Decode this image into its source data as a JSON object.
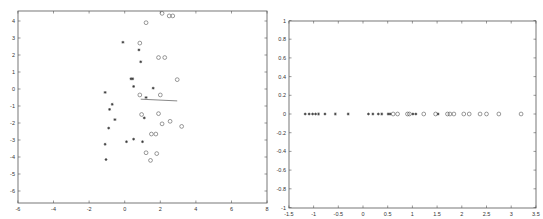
{
  "chart_data": [
    {
      "type": "scatter",
      "title": "",
      "xlabel": "",
      "ylabel": "",
      "xlim": [
        -6,
        8
      ],
      "ylim": [
        -6.6,
        4.5
      ],
      "xticks": [
        -6,
        -4,
        -2,
        0,
        2,
        4,
        6,
        8
      ],
      "yticks": [
        -6,
        -5,
        -4,
        -3,
        -2,
        -1,
        0,
        1,
        2,
        3,
        4
      ],
      "grid": false,
      "legend": null,
      "series": [
        {
          "name": "class 1",
          "marker": "*",
          "points": [
            [
              -0.1,
              2.75
            ],
            [
              0.8,
              2.3
            ],
            [
              0.9,
              1.6
            ],
            [
              0.35,
              0.6
            ],
            [
              0.45,
              0.6
            ],
            [
              0.5,
              0.15
            ],
            [
              1.6,
              0.05
            ],
            [
              1.2,
              -0.5
            ],
            [
              -1.1,
              -0.2
            ],
            [
              -0.7,
              -0.9
            ],
            [
              -0.85,
              -1.2
            ],
            [
              -0.55,
              -1.8
            ],
            [
              1.1,
              -1.7
            ],
            [
              -0.9,
              -2.3
            ],
            [
              0.1,
              -3.1
            ],
            [
              0.5,
              -2.95
            ],
            [
              1.0,
              -3.1
            ],
            [
              -1.1,
              -3.25
            ],
            [
              -1.05,
              -4.15
            ]
          ]
        },
        {
          "name": "class 2",
          "marker": "o",
          "points": [
            [
              2.1,
              4.45
            ],
            [
              2.5,
              4.3
            ],
            [
              2.7,
              4.3
            ],
            [
              1.2,
              3.9
            ],
            [
              0.85,
              2.7
            ],
            [
              1.9,
              1.85
            ],
            [
              2.25,
              1.85
            ],
            [
              2.95,
              0.55
            ],
            [
              0.85,
              -0.35
            ],
            [
              2.0,
              -0.35
            ],
            [
              0.95,
              -1.5
            ],
            [
              1.9,
              -1.45
            ],
            [
              2.1,
              -2.05
            ],
            [
              2.55,
              -1.9
            ],
            [
              3.2,
              -2.2
            ],
            [
              1.5,
              -2.65
            ],
            [
              1.75,
              -2.65
            ],
            [
              1.2,
              -3.75
            ],
            [
              1.8,
              -3.8
            ],
            [
              1.45,
              -4.2
            ]
          ]
        }
      ],
      "annotations": [
        {
          "type": "line",
          "from": [
            0.9,
            -0.6
          ],
          "to": [
            2.95,
            -0.7
          ]
        }
      ]
    },
    {
      "type": "scatter",
      "title": "",
      "xlabel": "",
      "ylabel": "",
      "xlim": [
        -1.5,
        3.5
      ],
      "ylim": [
        -1,
        1
      ],
      "xticks": [
        -1.5,
        -1,
        -0.5,
        0,
        0.5,
        1,
        1.5,
        2,
        2.5,
        3,
        3.5
      ],
      "yticks": [
        -1,
        -0.8,
        -0.6,
        -0.4,
        -0.2,
        0,
        0.2,
        0.4,
        0.6,
        0.8,
        1
      ],
      "grid": false,
      "legend": null,
      "series": [
        {
          "name": "class 1 (projected)",
          "marker": "*",
          "points": [
            [
              -1.17,
              0
            ],
            [
              -1.09,
              0
            ],
            [
              -1.02,
              0
            ],
            [
              -0.96,
              0
            ],
            [
              -0.9,
              0
            ],
            [
              -0.77,
              0
            ],
            [
              -0.56,
              0
            ],
            [
              -0.3,
              0
            ],
            [
              0.11,
              0
            ],
            [
              0.2,
              0
            ],
            [
              0.31,
              0
            ],
            [
              0.38,
              0
            ],
            [
              0.51,
              0
            ],
            [
              0.55,
              0
            ],
            [
              1.01,
              0
            ],
            [
              1.07,
              0
            ],
            [
              1.52,
              0
            ]
          ]
        },
        {
          "name": "class 2 (projected)",
          "marker": "o",
          "points": [
            [
              0.61,
              0
            ],
            [
              0.7,
              0
            ],
            [
              0.9,
              0
            ],
            [
              0.94,
              0
            ],
            [
              1.23,
              0
            ],
            [
              1.47,
              0
            ],
            [
              1.71,
              0
            ],
            [
              1.76,
              0
            ],
            [
              1.84,
              0
            ],
            [
              2.04,
              0
            ],
            [
              2.15,
              0
            ],
            [
              2.37,
              0
            ],
            [
              2.5,
              0
            ],
            [
              2.75,
              0
            ],
            [
              3.2,
              0
            ]
          ]
        }
      ]
    }
  ],
  "plots": {
    "left": {
      "frame": {
        "x0": 18,
        "y0": 11,
        "x1": 267,
        "y1": 203
      },
      "px_per_x": 17.8,
      "x_origin_px": 124.7,
      "px_per_y": 17.0,
      "y_origin_px": 89.0
    },
    "right": {
      "frame": {
        "x0": 17,
        "y0": 21,
        "x1": 264,
        "y1": 208
      },
      "px_per_x": 49.4,
      "x_origin_px": 91,
      "px_per_y": 93.5,
      "y_origin_px": 114
    }
  },
  "tick_labels": {
    "left_x": [
      "-6",
      "-4",
      "-2",
      "0",
      "2",
      "4",
      "6",
      "8"
    ],
    "left_y": [
      "-6",
      "-5",
      "-4",
      "-3",
      "-2",
      "-1",
      "0",
      "1",
      "2",
      "3",
      "4"
    ],
    "right_x": [
      "-1.5",
      "-1",
      "-0.5",
      "0",
      "0.5",
      "1",
      "1.5",
      "2",
      "2.5",
      "3",
      "3.5"
    ],
    "right_y": [
      "-1",
      "-0.8",
      "-0.6",
      "-0.4",
      "-0.2",
      "0",
      "0.2",
      "0.4",
      "0.6",
      "0.8",
      "1"
    ]
  },
  "markers": {
    "star": "*",
    "circle": "o"
  },
  "colors": {
    "axis": "#555555",
    "marker": "#333333",
    "background": "#ffffff"
  }
}
